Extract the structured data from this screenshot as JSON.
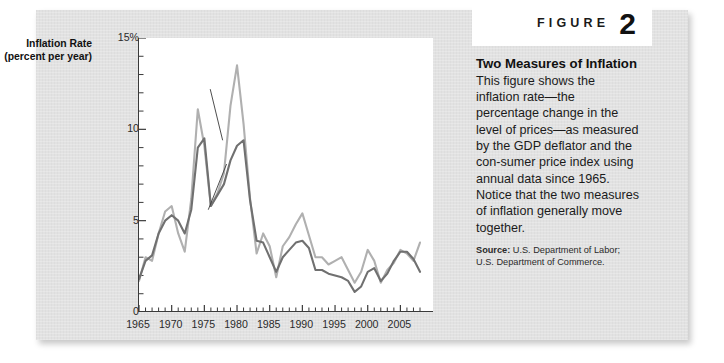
{
  "figure": {
    "word": "FIGURE",
    "number": "2"
  },
  "caption": {
    "title_line1": "Two Measures",
    "title_line2": "of Inflation",
    "body": "This figure shows the inflation rate—the percentage change in the level of prices—as measured by the GDP deflator and the con-sumer price index using annual data since 1965. Notice that the two measures of inflation generally move together.",
    "source_label": "Source:",
    "source_text": " U.S. Department of Labor; U.S. Department of Commerce."
  },
  "colors": {
    "panel": "#e2e2e2",
    "plot_background": "#ffffff",
    "axis": "#3a3a3a",
    "cpi_line": "#b0b0b0",
    "deflator_line": "#707070",
    "text": "#1a1a1a"
  },
  "chart_data": {
    "type": "line",
    "title": "Two Measures of Inflation",
    "xlabel": "",
    "ylabel": "Inflation Rate (percent per year)",
    "y_axis_title_line1": "Inflation Rate",
    "y_axis_title_line2": "(percent per year)",
    "xlim": [
      1965,
      2008
    ],
    "ylim": [
      0,
      15
    ],
    "yticks": [
      0,
      5,
      10,
      15
    ],
    "ytick_labels": [
      "0",
      "5",
      "10",
      "15%"
    ],
    "ytick_minor_step": 1,
    "xticks": [
      1965,
      1970,
      1975,
      1980,
      1985,
      1990,
      1995,
      2000,
      2005
    ],
    "xtick_labels": [
      "1965",
      "1970",
      "1975",
      "1980",
      "1985",
      "1990",
      "1995",
      "2000",
      "2005"
    ],
    "xtick_minor_step": 1,
    "grid": false,
    "legend": "inline-annotations",
    "annotations": [
      {
        "name": "cpi-label",
        "text": "CPI",
        "x": 1975.0,
        "y": 12.6
      },
      {
        "name": "gdp-deflator-label",
        "text": "GDP deflator",
        "x": 1974.5,
        "y": 5.1
      }
    ],
    "x": [
      1965,
      1966,
      1967,
      1968,
      1969,
      1970,
      1971,
      1972,
      1973,
      1974,
      1975,
      1976,
      1977,
      1978,
      1979,
      1980,
      1981,
      1982,
      1983,
      1984,
      1985,
      1986,
      1987,
      1988,
      1989,
      1990,
      1991,
      1992,
      1993,
      1994,
      1995,
      1996,
      1997,
      1998,
      1999,
      2000,
      2001,
      2002,
      2003,
      2004,
      2005,
      2006,
      2007,
      2008
    ],
    "series": [
      {
        "name": "CPI",
        "color": "#b0b0b0",
        "values": [
          1.7,
          3.0,
          2.8,
          4.3,
          5.5,
          5.8,
          4.3,
          3.3,
          6.2,
          11.1,
          9.1,
          5.8,
          6.5,
          7.6,
          11.3,
          13.5,
          10.3,
          6.2,
          3.2,
          4.3,
          3.6,
          1.9,
          3.6,
          4.1,
          4.8,
          5.4,
          4.2,
          3.0,
          3.0,
          2.6,
          2.8,
          3.0,
          2.3,
          1.6,
          2.2,
          3.4,
          2.8,
          1.6,
          2.3,
          2.7,
          3.4,
          3.2,
          2.8,
          3.8
        ]
      },
      {
        "name": "GDP deflator",
        "color": "#707070",
        "values": [
          1.8,
          2.8,
          3.1,
          4.3,
          5.0,
          5.3,
          5.0,
          4.3,
          5.6,
          9.0,
          9.5,
          5.8,
          6.4,
          7.0,
          8.3,
          9.1,
          9.4,
          6.1,
          3.9,
          3.8,
          3.0,
          2.2,
          3.0,
          3.4,
          3.8,
          3.9,
          3.5,
          2.3,
          2.3,
          2.1,
          2.0,
          1.9,
          1.7,
          1.1,
          1.4,
          2.2,
          2.4,
          1.7,
          2.1,
          2.8,
          3.3,
          3.3,
          2.9,
          2.2
        ]
      }
    ]
  }
}
